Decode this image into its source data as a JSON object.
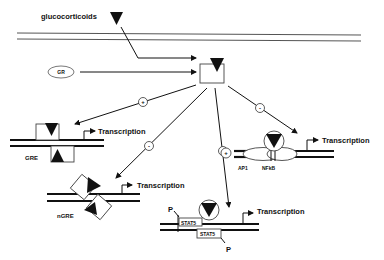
{
  "labels": {
    "ligand": "glucocorticoids",
    "receptor": "GR",
    "gre": "GRE",
    "ngre": "nGRE",
    "ap1": "AP1",
    "nfkb": "NFkB",
    "stat5_top": "STAT5",
    "stat5_bottom": "STAT5",
    "phospho_top": "P",
    "phospho_bottom": "P",
    "transcription_gre": "Transcription",
    "transcription_ngre": "Transcription",
    "transcription_nfkb": "Transcription",
    "transcription_stat5": "Transcription"
  },
  "signs": {
    "gre": "+",
    "ngre": "-",
    "stat5": "+",
    "nfkb": "-",
    "ap1": "+"
  },
  "colors": {
    "line": "#111111",
    "membrane": "#555555",
    "background": "#ffffff"
  }
}
